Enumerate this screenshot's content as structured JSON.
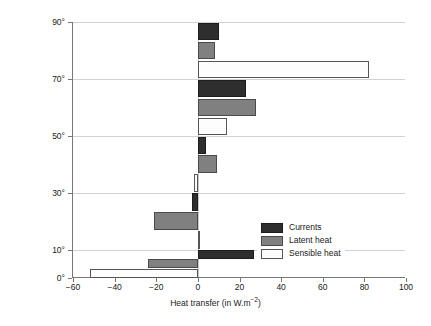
{
  "chart_data": {
    "type": "bar",
    "orientation": "horizontal",
    "title": "",
    "xlabel": "Heat transfer (in W.m⁻²)",
    "ylabel": "Latitudes (North or South)",
    "xlim": [
      -60,
      100
    ],
    "ylim": [
      0,
      90
    ],
    "xticks": [
      "−60",
      "−40",
      "−20",
      "0",
      "20",
      "40",
      "60",
      "80",
      "100"
    ],
    "xtick_values": [
      -60,
      -40,
      -20,
      0,
      20,
      40,
      60,
      80,
      100
    ],
    "yticks": [
      "0°",
      "10°",
      "30°",
      "50°",
      "70°",
      "90°"
    ],
    "ytick_values": [
      0,
      10,
      30,
      50,
      70,
      90
    ],
    "grid": "horizontal",
    "legend_position": "bottom-right",
    "categories": [
      "0–10°",
      "10–30°",
      "30–50°",
      "50–70°",
      "70–90°"
    ],
    "band_ranges": [
      [
        0,
        10
      ],
      [
        10,
        30
      ],
      [
        30,
        50
      ],
      [
        50,
        70
      ],
      [
        70,
        90
      ]
    ],
    "series": [
      {
        "name": "Currents",
        "color": "#2e2e2e",
        "values": [
          27,
          -3,
          4,
          23,
          10
        ]
      },
      {
        "name": "Latent heat",
        "color": "#808080",
        "values": [
          -24,
          -21,
          9,
          28,
          8
        ]
      },
      {
        "name": "Sensible heat",
        "color": "#ffffff",
        "values": [
          -52,
          1,
          -2,
          14,
          82
        ]
      }
    ]
  },
  "axis": {
    "x_label": "Heat transfer (in W.m",
    "x_label_sup": "−2",
    "x_label_tail": ")",
    "y_label": "Latitudes (North or South)"
  },
  "legend": {
    "items": [
      {
        "label": "Currents",
        "swatch": "currents"
      },
      {
        "label": "Latent heat",
        "swatch": "latent"
      },
      {
        "label": "Sensible heat",
        "swatch": "sensible"
      }
    ]
  }
}
